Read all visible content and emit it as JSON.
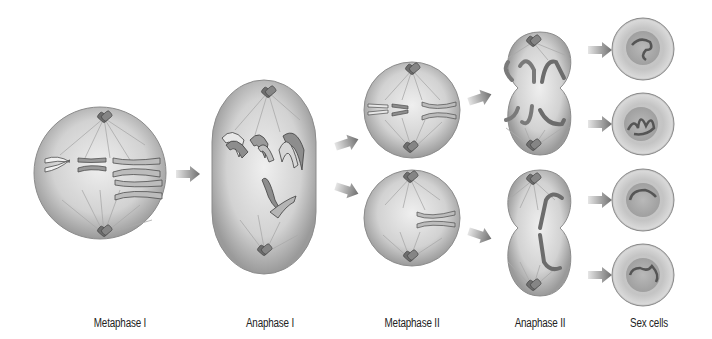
{
  "background": "#ffffff",
  "colors": {
    "cell_light": "#e6e6e6",
    "cell_mid": "#bdbdbd",
    "cell_edge": "#8a8a8a",
    "chromosome": "#7a7a7a",
    "chromosome_light": "#f2f2f2",
    "spindle": "#a8a8a8",
    "arrow": "#7d7d7d",
    "nucleus": "#9c9c9c"
  },
  "stages": [
    {
      "id": "metaphase-1",
      "label": "Metaphase I",
      "label_x": 120
    },
    {
      "id": "anaphase-1",
      "label": "Anaphase I",
      "label_x": 270
    },
    {
      "id": "metaphase-2",
      "label": "Metaphase II",
      "label_x": 412
    },
    {
      "id": "anaphase-2",
      "label": "Anaphase  II",
      "label_x": 540
    },
    {
      "id": "sex-cells",
      "label": "Sex cells",
      "label_x": 649
    }
  ]
}
